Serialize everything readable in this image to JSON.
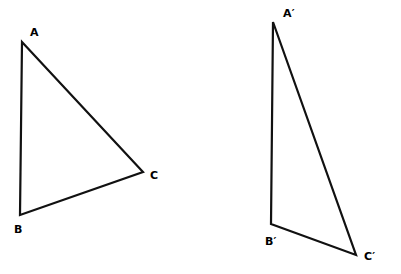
{
  "figure": {
    "background_color": "#ffffff",
    "stroke_color": "#111111",
    "stroke_width": 2.2,
    "label_color": "#000000"
  },
  "shapes": [
    {
      "name": "triangle-abc",
      "points": "22,42 20,215 143,172",
      "vertices": [
        {
          "id": "A",
          "label": "A",
          "x": 22,
          "y": 42
        },
        {
          "id": "B",
          "label": "B",
          "x": 20,
          "y": 215
        },
        {
          "id": "C",
          "label": "C",
          "x": 143,
          "y": 172
        }
      ]
    },
    {
      "name": "triangle-a-prime-b-prime-c-prime",
      "points": "273,22 271,224 356,255",
      "vertices": [
        {
          "id": "A'",
          "label": "A′",
          "x": 273,
          "y": 22
        },
        {
          "id": "B'",
          "label": "B′",
          "x": 271,
          "y": 224
        },
        {
          "id": "C'",
          "label": "C′",
          "x": 356,
          "y": 255
        }
      ]
    }
  ],
  "labels": [
    {
      "name": "label-a",
      "text": "A",
      "left": 30,
      "top": 27
    },
    {
      "name": "label-b",
      "text": "B",
      "left": 14,
      "top": 224
    },
    {
      "name": "label-c",
      "text": "C",
      "left": 150,
      "top": 170
    },
    {
      "name": "label-a-prime",
      "text": "A′",
      "left": 283,
      "top": 8
    },
    {
      "name": "label-b-prime",
      "text": "B′",
      "left": 265,
      "top": 236
    },
    {
      "name": "label-c-prime",
      "text": "C′",
      "left": 364,
      "top": 251
    }
  ]
}
